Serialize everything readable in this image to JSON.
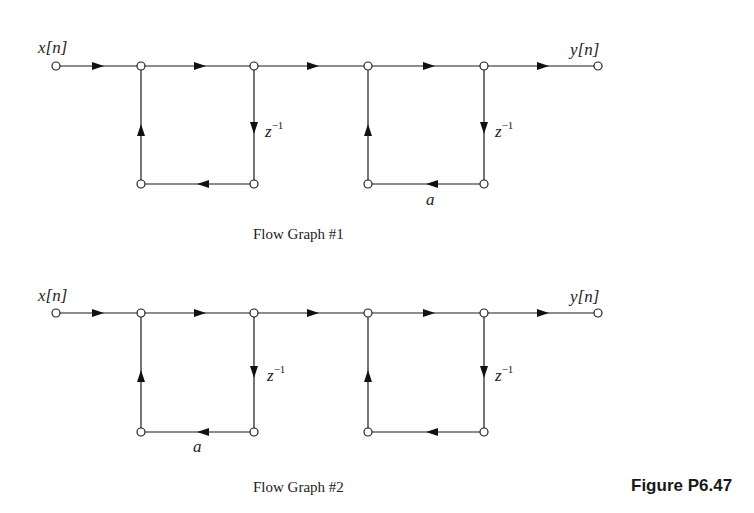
{
  "figure": {
    "label": "Figure P6.47",
    "graphs": [
      {
        "id": 1,
        "caption": "Flow Graph #1",
        "input_label": "x[n]",
        "output_label": "y[n]",
        "delay_label": "z",
        "delay_exp": "−1",
        "gain_label": "a",
        "gain_position": "right-section-bottom-branch",
        "sections": [
          {
            "feedback_branch": "z^-1 down, unity left, unity up",
            "gain": "1"
          },
          {
            "feedback_branch": "z^-1 down, a left, unity up",
            "gain": "a"
          }
        ]
      },
      {
        "id": 2,
        "caption": "Flow Graph #2",
        "input_label": "x[n]",
        "output_label": "y[n]",
        "delay_label": "z",
        "delay_exp": "−1",
        "gain_label": "a",
        "gain_position": "left-section-bottom-branch",
        "sections": [
          {
            "feedback_branch": "z^-1 down, a left, unity up",
            "gain": "a"
          },
          {
            "feedback_branch": "z^-1 down, unity left, unity up",
            "gain": "1"
          }
        ]
      }
    ]
  }
}
